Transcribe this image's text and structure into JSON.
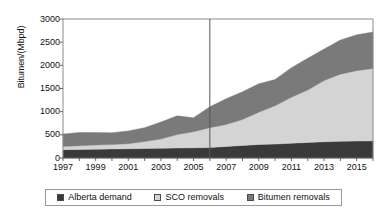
{
  "chart_data": {
    "type": "area",
    "stacked": true,
    "title": "",
    "xlabel": "",
    "ylabel": "Bitumen/(Mbpd)",
    "ylim": [
      0,
      3000
    ],
    "ytick_step": 500,
    "ytick_labels": [
      "3000",
      "2500",
      "2000",
      "1500",
      "1000",
      "500",
      "0"
    ],
    "ytick_values": [
      3000,
      2500,
      2000,
      1500,
      1000,
      500,
      0
    ],
    "xlim": [
      1997,
      2016
    ],
    "xtick_labels": [
      "1997",
      "1999",
      "2001",
      "2003",
      "2005",
      "2007",
      "2009",
      "2011",
      "2013",
      "2015"
    ],
    "xtick_values": [
      1997,
      1999,
      2001,
      2003,
      2005,
      2007,
      2009,
      2011,
      2013,
      2015
    ],
    "x": [
      1997,
      1998,
      1999,
      2000,
      2001,
      2002,
      2003,
      2004,
      2005,
      2006,
      2007,
      2008,
      2009,
      2010,
      2011,
      2012,
      2013,
      2014,
      2015,
      2016
    ],
    "grid": false,
    "legend_position": "bottom",
    "divider_line_x": 2006,
    "series": [
      {
        "name": "Alberta demand",
        "color": "#3a3a3a",
        "values": [
          180,
          185,
          190,
          195,
          200,
          205,
          210,
          215,
          220,
          225,
          250,
          270,
          290,
          300,
          320,
          335,
          350,
          360,
          365,
          370
        ]
      },
      {
        "name": "SCO removals",
        "color": "#d4d4d4",
        "values": [
          70,
          80,
          90,
          95,
          110,
          150,
          200,
          290,
          345,
          430,
          475,
          560,
          700,
          830,
          990,
          1130,
          1320,
          1450,
          1520,
          1560
        ]
      },
      {
        "name": "Bitumen removals",
        "color": "#7a7a7a",
        "values": [
          270,
          285,
          270,
          255,
          275,
          300,
          365,
          405,
          305,
          450,
          555,
          600,
          615,
          565,
          640,
          690,
          680,
          735,
          775,
          790
        ]
      }
    ],
    "totals": [
      520,
      550,
      550,
      545,
      585,
      655,
      775,
      910,
      870,
      1105,
      1280,
      1430,
      1605,
      1695,
      1950,
      2155,
      2350,
      2545,
      2660,
      2720
    ]
  },
  "legend": {
    "items": [
      {
        "label": "Alberta demand",
        "color": "#3a3a3a"
      },
      {
        "label": "SCO removals",
        "color": "#d4d4d4"
      },
      {
        "label": "Bitumen removals",
        "color": "#7a7a7a"
      }
    ]
  },
  "colors": {
    "axis": "#666666",
    "frame": "#8a8a8a",
    "divider": "#555555",
    "background": "#ffffff"
  }
}
